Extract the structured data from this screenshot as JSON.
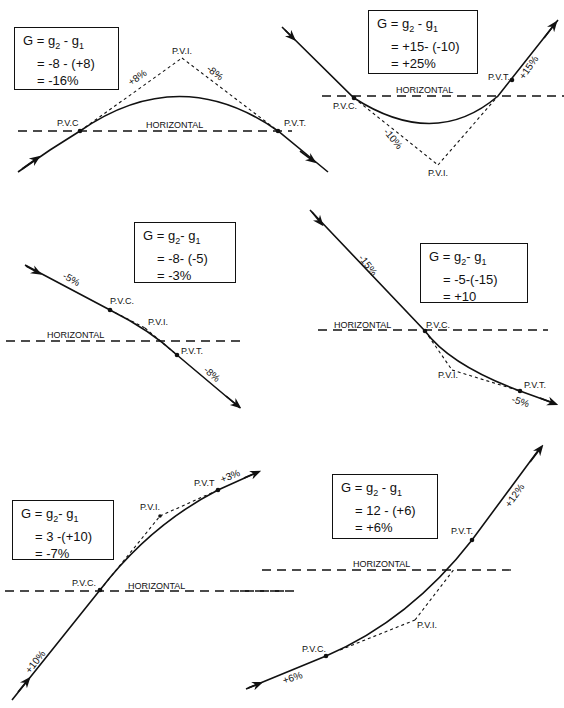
{
  "panels": [
    {
      "id": "crest-1",
      "formula": {
        "line1_lhs": "G",
        "line1_rhs_a": "g",
        "sub2": "2",
        "line1_rhs_mid": " - g",
        "sub1": "1",
        "line2": "= -8 - (+8)",
        "line3": "= -16%"
      },
      "labels": {
        "pvc": "P.V.C",
        "pvi": "P.V.I.",
        "pvt": "P.V.T.",
        "horizontal": "HORIZONTAL"
      },
      "grades": {
        "g1": "+8%",
        "g2": "-8%"
      }
    },
    {
      "id": "sag-1",
      "formula": {
        "line1_lhs": "G",
        "line1_rhs_a": "g",
        "sub2": "2",
        "line1_rhs_mid": " - g",
        "sub1": "1",
        "line2": "= +15- (-10)",
        "line3": "= +25%"
      },
      "labels": {
        "pvc": "P.V.C.",
        "pvi": "P.V.I.",
        "pvt": "P.V.T.",
        "horizontal": "HORIZONTAL"
      },
      "grades": {
        "g1": "-10%",
        "g2": "+15%"
      }
    },
    {
      "id": "crest-2",
      "formula": {
        "line1_lhs": "G",
        "line1_rhs_a": "g",
        "sub2": "2",
        "line1_rhs_mid": "- g",
        "sub1": "1",
        "line2": "= -8- (-5)",
        "line3": "= -3%"
      },
      "labels": {
        "pvc": "P.V.C.",
        "pvi": "P.V.I.",
        "pvt": "P.V.T.",
        "horizontal": "HORIZONTAL"
      },
      "grades": {
        "g1": "-5%",
        "g2": "-8%"
      }
    },
    {
      "id": "sag-2",
      "formula": {
        "line1_lhs": "G",
        "line1_rhs_a": "g",
        "sub2": "2",
        "line1_rhs_mid": "- g",
        "sub1": "1",
        "line2": "= -5-(-15)",
        "line3": "= +10"
      },
      "labels": {
        "pvc": "P.V.C.",
        "pvi": "P.V.I.",
        "pvt": "P.V.T.",
        "horizontal": "HORIZONTAL"
      },
      "grades": {
        "g1": "-15%",
        "g2": "-5%"
      }
    },
    {
      "id": "crest-3",
      "formula": {
        "line1_lhs": "G",
        "line1_rhs_a": "g",
        "sub2": "2",
        "line1_rhs_mid": "- g",
        "sub1": "1",
        "line2": "= 3 -(+10)",
        "line3": "= -7%"
      },
      "labels": {
        "pvc": "P.V.C.",
        "pvi": "P.V.I.",
        "pvt": "P.V.T",
        "horizontal": "HORIZONTAL"
      },
      "grades": {
        "g1": "+10%",
        "g2": "+3%"
      }
    },
    {
      "id": "sag-3",
      "formula": {
        "line1_lhs": "G",
        "line1_rhs_a": "g",
        "sub2": "2",
        "line1_rhs_mid": " - g",
        "sub1": "1",
        "line2": "= 12 - (+6)",
        "line3": "= +6%"
      },
      "labels": {
        "pvc": "P.V.C.",
        "pvi": "P.V.I.",
        "pvt": "P.V.T.",
        "horizontal": "HORIZONTAL"
      },
      "grades": {
        "g1": "+6%",
        "g2": "+12%"
      }
    }
  ]
}
